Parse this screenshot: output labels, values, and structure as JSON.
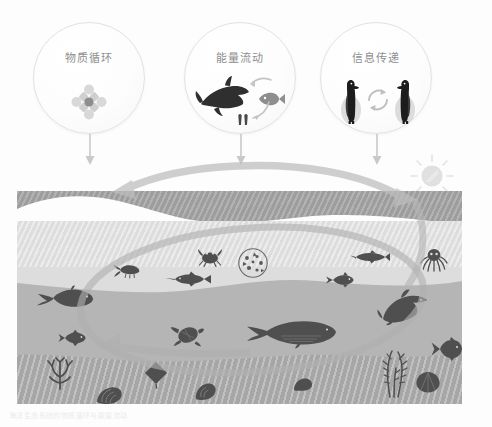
{
  "scene": {
    "title": "海洋生态系统示意图",
    "background_color": "#fdfdfd"
  },
  "concepts": [
    {
      "label": "物质循环",
      "icon": "material-cycle-icon",
      "left": 33,
      "top": 22,
      "size": 112,
      "arrow_name": "arrow-down-material-cycle",
      "arrow_x": 89,
      "arrow_top": 134,
      "arrow_height": 31
    },
    {
      "label": "能量流动",
      "icon": "shark-and-fish-icon",
      "left": 184,
      "top": 22,
      "size": 112,
      "arrow_name": "arrow-down-energy-flow",
      "arrow_x": 240,
      "arrow_top": 134,
      "arrow_height": 31
    },
    {
      "label": "信息传递",
      "icon": "penguins-exchange-icon",
      "left": 320,
      "top": 22,
      "size": 112,
      "arrow_name": "arrow-down-information-transfer",
      "arrow_x": 376,
      "arrow_top": 134,
      "arrow_height": 31
    }
  ],
  "sun": {
    "name": "sun-icon",
    "left": 420,
    "top": 160,
    "radius": 13,
    "color": "#e2e2e2",
    "ray_count": 8
  },
  "ocean": {
    "left": 17,
    "top": 191,
    "width": 445,
    "height": 213,
    "layers": [
      {
        "name": "deep-water-band",
        "color": "#9d9d9d",
        "top": 0,
        "height": 40
      },
      {
        "name": "surface-light-band",
        "color": "#dddddd",
        "top": 30,
        "height": 58
      },
      {
        "name": "mid-water-band",
        "color": "#b5b5b5",
        "top": 85,
        "height": 78
      },
      {
        "name": "seafloor-band",
        "color": "#a6a6a6",
        "top": 160,
        "height": 53
      }
    ],
    "creatures": [
      {
        "name": "shrimp",
        "left": 95,
        "top": 72,
        "w": 26,
        "h": 14
      },
      {
        "name": "crab",
        "left": 182,
        "top": 58,
        "w": 22,
        "h": 16
      },
      {
        "name": "plankton-circle",
        "left": 222,
        "top": 58,
        "w": 30,
        "h": 30
      },
      {
        "name": "swordfish",
        "left": 150,
        "top": 82,
        "w": 40,
        "h": 12
      },
      {
        "name": "small-shark",
        "left": 335,
        "top": 60,
        "w": 34,
        "h": 12
      },
      {
        "name": "octopus",
        "left": 405,
        "top": 58,
        "w": 26,
        "h": 22
      },
      {
        "name": "tuna-fish",
        "left": 310,
        "top": 82,
        "w": 28,
        "h": 14
      },
      {
        "name": "manatee",
        "left": 22,
        "top": 96,
        "w": 54,
        "h": 22
      },
      {
        "name": "reef-fish-left",
        "left": 43,
        "top": 140,
        "w": 26,
        "h": 16
      },
      {
        "name": "sea-turtle",
        "left": 155,
        "top": 133,
        "w": 30,
        "h": 22
      },
      {
        "name": "dolphin",
        "left": 365,
        "top": 102,
        "w": 48,
        "h": 30
      },
      {
        "name": "blue-whale",
        "left": 230,
        "top": 128,
        "w": 86,
        "h": 28
      },
      {
        "name": "angel-fish",
        "left": 415,
        "top": 148,
        "w": 30,
        "h": 22
      },
      {
        "name": "coral-branch",
        "left": 25,
        "top": 168,
        "w": 38,
        "h": 28
      },
      {
        "name": "stingray",
        "left": 128,
        "top": 172,
        "w": 22,
        "h": 24
      },
      {
        "name": "seaweed",
        "left": 360,
        "top": 160,
        "w": 36,
        "h": 44
      },
      {
        "name": "shell-right",
        "left": 400,
        "top": 182,
        "w": 24,
        "h": 20
      },
      {
        "name": "sea-snail",
        "left": 178,
        "top": 192,
        "w": 22,
        "h": 18
      },
      {
        "name": "clam-shell",
        "left": 80,
        "top": 196,
        "w": 26,
        "h": 18
      },
      {
        "name": "small-rock",
        "left": 278,
        "top": 188,
        "w": 18,
        "h": 12
      }
    ]
  },
  "cycle_arrow": {
    "name": "ecosystem-cycle-loop",
    "color": "#bdbdbd",
    "description": "large elliptical circulation loop with arrowheads at upper-left and lower-left"
  },
  "caption": {
    "text": "海洋生态系统的物质循环与能量流动"
  }
}
